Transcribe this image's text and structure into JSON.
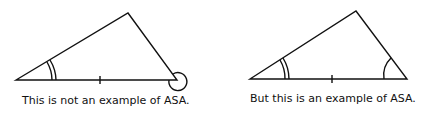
{
  "diagrams": [
    {
      "id": "left",
      "caption": "This is not an example of ASA.",
      "vertices": [
        [
          16,
          80
        ],
        [
          128,
          13
        ],
        [
          177,
          80
        ]
      ],
      "marks": {
        "double_arc_at": "left-vertex",
        "side_tick_on": "base",
        "loop_at": "right-vertex"
      }
    },
    {
      "id": "right",
      "caption": "But this is an example of ASA.",
      "vertices": [
        [
          250,
          79
        ],
        [
          356,
          11
        ],
        [
          407,
          79
        ]
      ],
      "marks": {
        "double_arc_at": "left-vertex",
        "side_tick_on": "base",
        "single_arc_at": "right-vertex"
      }
    }
  ],
  "colors": {
    "stroke": "#111111",
    "background": "#ffffff"
  }
}
